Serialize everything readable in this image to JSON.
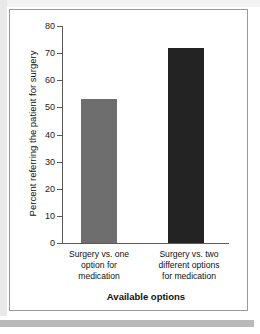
{
  "chart_data": {
    "type": "bar",
    "title": "",
    "xlabel": "Available options",
    "ylabel": "Percent referring the patient for surgery",
    "categories": [
      "Surgery vs. one option for medication",
      "Surgery vs. two different options for medication"
    ],
    "values": [
      53,
      72
    ],
    "ylim": [
      0,
      80
    ],
    "ytick_labels": [
      "80",
      "70",
      "60",
      "50",
      "40",
      "30",
      "20",
      "10",
      "0"
    ],
    "ytick_values": [
      80,
      70,
      60,
      50,
      40,
      30,
      20,
      10,
      0
    ],
    "grid": false,
    "legend": "none",
    "bar_colors": [
      "#6e6e6e",
      "#232323"
    ]
  },
  "axis": {
    "y_title": "Percent referring the patient for surgery",
    "x_title": "Available options"
  },
  "category_lines": {
    "first": [
      "Surgery vs. one",
      "option for",
      "medication"
    ],
    "second": [
      "Surgery vs. two",
      "different options",
      "for medication"
    ]
  },
  "colors": {
    "axis": "#5a5a5a",
    "frame": "#9a9a9a",
    "text": "#111111",
    "bar_light": "#6e6e6e",
    "bar_dark": "#232323",
    "page_edge": "#e9e9e9",
    "bottom_band": "#b9b9b9"
  }
}
